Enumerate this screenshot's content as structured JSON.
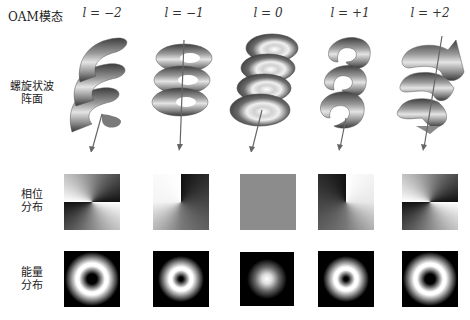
{
  "figure": {
    "title": "OAM模态",
    "columns": [
      {
        "label": "l = −2",
        "l": -2,
        "cx": 102
      },
      {
        "label": "l = −1",
        "l": -1,
        "cx": 184
      },
      {
        "label": "l = 0",
        "l": 0,
        "cx": 268
      },
      {
        "label": "l = +1",
        "l": 1,
        "cx": 350
      },
      {
        "label": "l = +2",
        "l": 2,
        "cx": 430
      }
    ],
    "rows": [
      {
        "label_line1": "螺旋状波",
        "label_line2": "阵面",
        "kind": "helical-wavefront"
      },
      {
        "label_line1": "相位",
        "label_line2": "分布",
        "kind": "phase-distribution"
      },
      {
        "label_line1": "能量",
        "label_line2": "分布",
        "kind": "intensity-distribution"
      }
    ],
    "colors": {
      "helix_dark": "#4a4a4a",
      "helix_light": "#e6e6e6",
      "phase_flat": "#8c8c8c",
      "background": "#ffffff",
      "beam_background": "#000000"
    }
  }
}
